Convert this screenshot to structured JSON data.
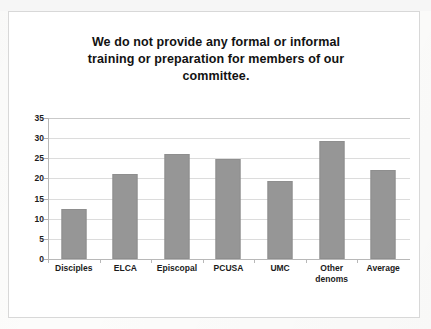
{
  "slide": {
    "title_lines": [
      "We do not provide any formal or informal",
      "training or preparation for members of our",
      "committee."
    ]
  },
  "chart_data": {
    "type": "bar",
    "title": "We do not provide any formal or informal training or preparation for members of our committee.",
    "categories": [
      "Disciples",
      "ELCA",
      "Episcopal",
      "PCUSA",
      "UMC",
      "Other denoms",
      "Average"
    ],
    "category_lines": [
      [
        "Disciples"
      ],
      [
        "ELCA"
      ],
      [
        "Episcopal"
      ],
      [
        "PCUSA"
      ],
      [
        "UMC"
      ],
      [
        "Other",
        "denoms"
      ],
      [
        "Average"
      ]
    ],
    "values": [
      12.4,
      21.1,
      26.1,
      24.8,
      19.4,
      29.3,
      22.0
    ],
    "xlabel": "",
    "ylabel": "",
    "ylim": [
      0,
      35
    ],
    "yticks": [
      0,
      5,
      10,
      15,
      20,
      25,
      30,
      35
    ],
    "ytick_labels": [
      "0",
      "5",
      "10",
      "15",
      "20",
      "25",
      "30",
      "35"
    ],
    "grid": true,
    "legend": false,
    "bar_color": "#969696",
    "gridline_color": "#dcdcdc",
    "axis_color": "#b8b8b8",
    "text_color": "#1b1b1b"
  }
}
